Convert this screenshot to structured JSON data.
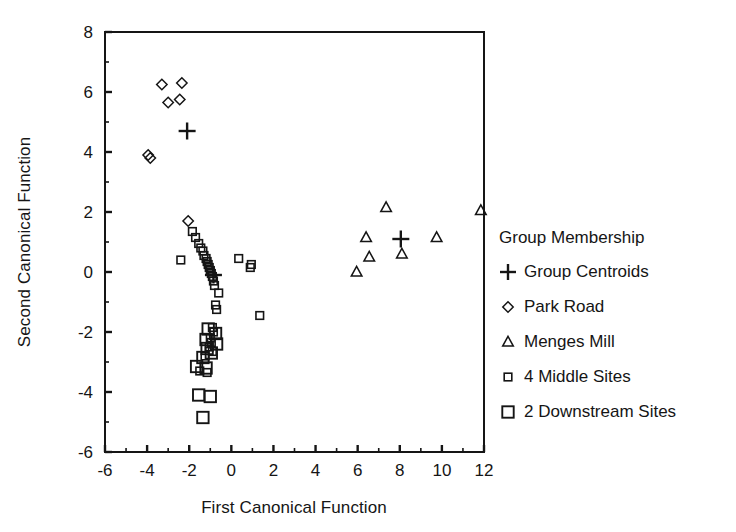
{
  "chart_data": {
    "type": "scatter",
    "title": "",
    "xlabel": "First Canonical Function",
    "ylabel": "Second Canonical Function",
    "xlim": [
      -6,
      12
    ],
    "ylim": [
      -6,
      8
    ],
    "xticks": [
      -6,
      -4,
      -2,
      0,
      2,
      4,
      6,
      8,
      10,
      12
    ],
    "yticks": [
      -6,
      -4,
      -2,
      0,
      2,
      4,
      6,
      8
    ],
    "xtick_labels": [
      "-6",
      "-4",
      "-2",
      "0",
      "2",
      "4",
      "6",
      "8",
      "10",
      "12"
    ],
    "ytick_labels": [
      "-6",
      "-4",
      "-2",
      "0",
      "2",
      "4",
      "6",
      "8"
    ],
    "minor_ticks": true,
    "grid": false,
    "legend_position": "right",
    "legend_title": "Group Membership",
    "series": [
      {
        "name": "Group Centroids",
        "marker": "plus",
        "points": [
          [
            -2.1,
            4.7
          ],
          [
            -0.85,
            -0.1
          ],
          [
            8.05,
            1.1
          ]
        ]
      },
      {
        "name": "Park Road",
        "marker": "diamond",
        "points": [
          [
            -3.3,
            6.25
          ],
          [
            -2.35,
            6.3
          ],
          [
            -3.0,
            5.65
          ],
          [
            -2.45,
            5.75
          ],
          [
            -3.95,
            3.9
          ],
          [
            -3.85,
            3.8
          ],
          [
            -2.05,
            1.7
          ]
        ]
      },
      {
        "name": "Menges Mill",
        "marker": "triangle",
        "points": [
          [
            7.35,
            2.15
          ],
          [
            6.4,
            1.15
          ],
          [
            9.75,
            1.15
          ],
          [
            8.1,
            0.6
          ],
          [
            6.55,
            0.5
          ],
          [
            5.95,
            0.0
          ],
          [
            11.85,
            2.05
          ]
        ]
      },
      {
        "name": "4 Middle Sites",
        "marker": "square-small",
        "points": [
          [
            -1.85,
            1.35
          ],
          [
            -1.7,
            1.15
          ],
          [
            -1.55,
            0.95
          ],
          [
            -1.45,
            0.8
          ],
          [
            -1.35,
            0.7
          ],
          [
            -1.3,
            0.55
          ],
          [
            -1.2,
            0.45
          ],
          [
            -1.15,
            0.35
          ],
          [
            -1.1,
            0.25
          ],
          [
            -1.05,
            0.15
          ],
          [
            -1.0,
            0.05
          ],
          [
            -0.95,
            -0.05
          ],
          [
            -0.9,
            -0.15
          ],
          [
            -0.85,
            -0.3
          ],
          [
            -0.8,
            -0.45
          ],
          [
            -2.4,
            0.4
          ],
          [
            0.35,
            0.45
          ],
          [
            0.95,
            0.25
          ],
          [
            0.9,
            0.15
          ],
          [
            -0.6,
            -0.7
          ],
          [
            -0.75,
            -1.1
          ],
          [
            -0.7,
            -1.25
          ],
          [
            1.35,
            -1.45
          ],
          [
            -0.9,
            -1.85
          ],
          [
            -0.85,
            -2.0
          ],
          [
            -1.0,
            -2.2
          ],
          [
            -0.95,
            -2.35
          ],
          [
            -1.05,
            -2.5
          ],
          [
            -0.9,
            -2.65
          ],
          [
            -1.25,
            -2.8
          ],
          [
            -1.5,
            -3.3
          ],
          [
            -1.15,
            -3.35
          ]
        ]
      },
      {
        "name": "2 Downstream Sites",
        "marker": "square-large",
        "points": [
          [
            -1.1,
            -1.9
          ],
          [
            -0.75,
            -2.05
          ],
          [
            -1.2,
            -2.25
          ],
          [
            -0.7,
            -2.4
          ],
          [
            -1.15,
            -2.55
          ],
          [
            -0.95,
            -2.7
          ],
          [
            -1.35,
            -2.85
          ],
          [
            -1.65,
            -3.15
          ],
          [
            -1.2,
            -3.2
          ],
          [
            -1.55,
            -4.1
          ],
          [
            -1.0,
            -4.15
          ],
          [
            -1.35,
            -4.85
          ]
        ]
      }
    ]
  },
  "legend": {
    "title": "Group Membership",
    "entries": [
      {
        "label": "Group Centroids",
        "icon": "plus-marker-icon"
      },
      {
        "label": "Park Road",
        "icon": "diamond-marker-icon"
      },
      {
        "label": "Menges Mill",
        "icon": "triangle-marker-icon"
      },
      {
        "label": "4 Middle Sites",
        "icon": "small-square-marker-icon"
      },
      {
        "label": "2 Downstream Sites",
        "icon": "large-square-marker-icon"
      }
    ]
  },
  "style": {
    "ink": "#151515",
    "background": "#ffffff"
  }
}
